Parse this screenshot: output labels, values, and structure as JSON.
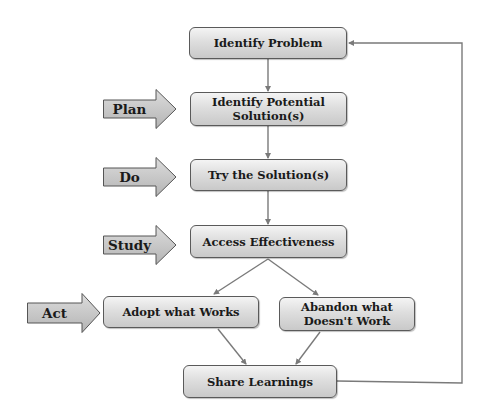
{
  "diagram": {
    "type": "flowchart",
    "colors": {
      "box_fill_top": "#f4f4f4",
      "box_fill_bottom": "#c9c9c9",
      "box_border": "#5a5a5a",
      "connector": "#7a7a7a",
      "phase_arrow_fill": "#c4c4c4",
      "text": "#1a1a1a"
    },
    "nodes": [
      {
        "id": "identify_problem",
        "label": "Identify Problem"
      },
      {
        "id": "identify_solutions",
        "label": "Identify Potential\nSolution(s)"
      },
      {
        "id": "try_solutions",
        "label": "Try the Solution(s)"
      },
      {
        "id": "access_effectiveness",
        "label": "Access Effectiveness"
      },
      {
        "id": "adopt",
        "label": "Adopt what Works"
      },
      {
        "id": "abandon",
        "label": "Abandon what\nDoesn't Work"
      },
      {
        "id": "share",
        "label": "Share Learnings"
      }
    ],
    "phases": [
      {
        "id": "plan",
        "label": "Plan",
        "points_to": "identify_solutions"
      },
      {
        "id": "do",
        "label": "Do",
        "points_to": "try_solutions"
      },
      {
        "id": "study",
        "label": "Study",
        "points_to": "access_effectiveness"
      },
      {
        "id": "act",
        "label": "Act",
        "points_to": "adopt"
      }
    ],
    "edges": [
      {
        "from": "identify_problem",
        "to": "identify_solutions"
      },
      {
        "from": "identify_solutions",
        "to": "try_solutions"
      },
      {
        "from": "try_solutions",
        "to": "access_effectiveness"
      },
      {
        "from": "access_effectiveness",
        "to": "adopt"
      },
      {
        "from": "access_effectiveness",
        "to": "abandon"
      },
      {
        "from": "adopt",
        "to": "share"
      },
      {
        "from": "abandon",
        "to": "share"
      },
      {
        "from": "share",
        "to": "identify_problem",
        "style": "feedback-loop-right"
      }
    ]
  }
}
